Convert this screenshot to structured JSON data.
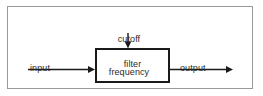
{
  "diagram": {
    "frame": {
      "border_color": "#999999"
    },
    "block": {
      "label": "filter",
      "border_color": "#1a1a1a",
      "fill_color": "#ffffff"
    },
    "labels": {
      "cutoff": "cutoff\nfrequency",
      "cutoff_line1": "cutoff",
      "cutoff_line2": "frequency",
      "input": "input\nsignal",
      "input_line1": "input",
      "input_line2": "signal",
      "output": "output\nsignal",
      "output_line1": "output",
      "output_line2": "signal"
    },
    "arrows": [
      {
        "name": "input-signal-arrow",
        "direction": "right",
        "from": [
          28,
          69
        ],
        "to": [
          95,
          69
        ],
        "color": "#1a1a1a"
      },
      {
        "name": "cutoff-frequency-arrow",
        "direction": "down",
        "from": [
          128,
          33
        ],
        "to": [
          128,
          48
        ],
        "color": "#1a1a1a"
      },
      {
        "name": "output-signal-arrow",
        "direction": "right",
        "from": [
          170,
          69
        ],
        "to": [
          233,
          69
        ],
        "color": "#1a1a1a"
      }
    ],
    "text_color": "#2b2b2b"
  }
}
